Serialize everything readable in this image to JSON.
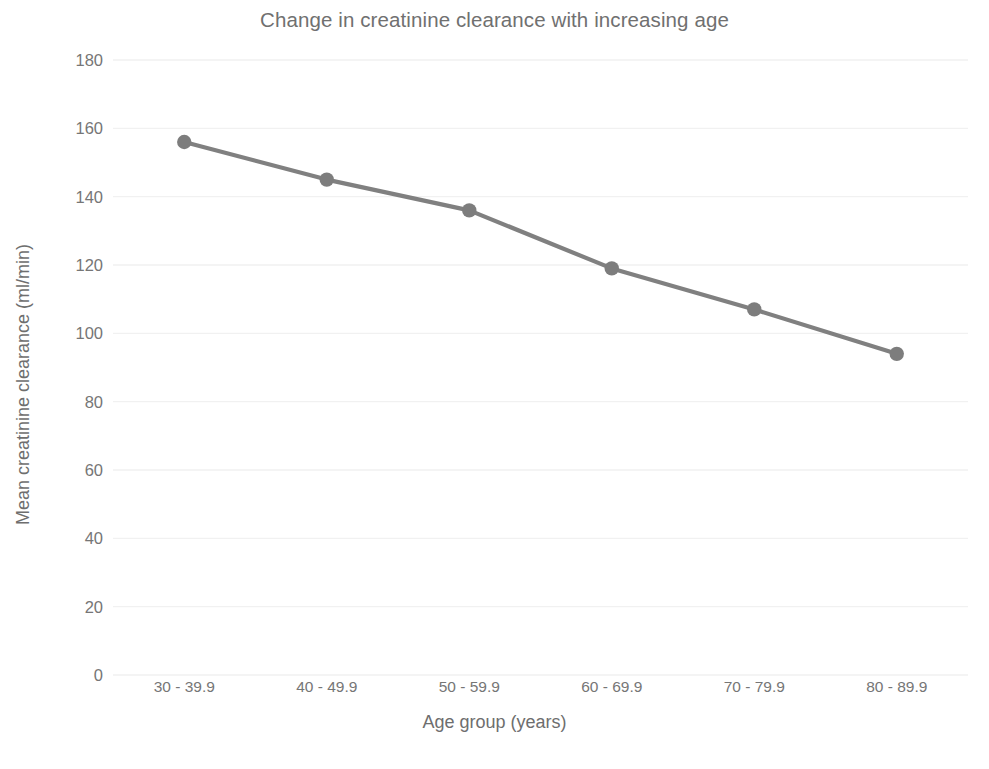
{
  "chart_data": {
    "type": "line",
    "title": "Change in creatinine clearance with increasing age",
    "xlabel": "Age group (years)",
    "ylabel": "Mean creatinine clearance (ml/min)",
    "categories": [
      "30 - 39.9",
      "40 - 49.9",
      "50 - 59.9",
      "60 - 69.9",
      "70 - 79.9",
      "80 - 89.9"
    ],
    "values": [
      156,
      145,
      136,
      119,
      107,
      94
    ],
    "series": [
      {
        "name": "Mean creatinine clearance",
        "values": [
          156,
          145,
          136,
          119,
          107,
          94
        ]
      }
    ],
    "ylim": [
      0,
      180
    ],
    "yticks": [
      0,
      20,
      40,
      60,
      80,
      100,
      120,
      140,
      160,
      180
    ],
    "ytick_labels": [
      "0",
      "20",
      "40",
      "60",
      "80",
      "100",
      "120",
      "140",
      "160",
      "180"
    ],
    "grid": true,
    "grid_axis": "y",
    "legend": false,
    "legend_position": "none",
    "marker": "circle",
    "colors": {
      "line": "#808080",
      "marker": "#7d7d7d",
      "grid": "#f1f1f1",
      "text": "#6e6e6e",
      "tick_text": "#767676",
      "title_text": "#707070",
      "background": "#ffffff"
    }
  }
}
